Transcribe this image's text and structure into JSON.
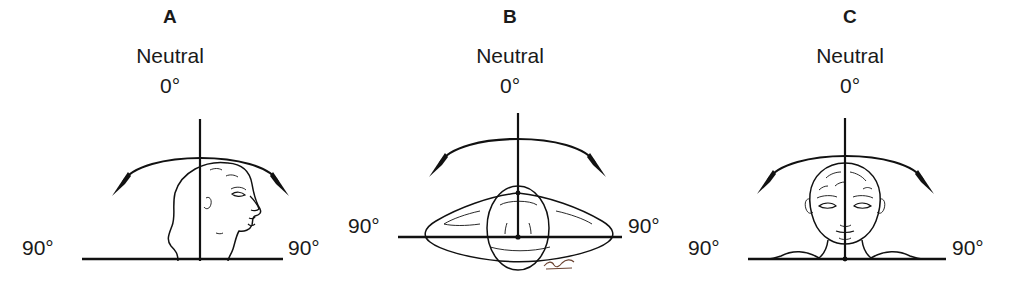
{
  "figure": {
    "background": "#ffffff",
    "ink_color": "#111111",
    "signature_color": "#6b4230"
  },
  "panels": [
    {
      "id": "panel-a",
      "letter": "A",
      "view": "lateral-profile-head",
      "motion": "flexion-extension",
      "neutral_word": "Neutral",
      "neutral_degrees": "0°",
      "left_degrees": "90°",
      "right_degrees": "90°",
      "baseline_y": 259,
      "arrow": "double-headed-arc"
    },
    {
      "id": "panel-b",
      "letter": "B",
      "view": "superior-axial-head-shoulders",
      "motion": "rotation",
      "neutral_word": "Neutral",
      "neutral_degrees": "0°",
      "left_degrees": "90°",
      "right_degrees": "90°",
      "baseline_y": 237,
      "arrow": "double-headed-arc",
      "signature": true
    },
    {
      "id": "panel-c",
      "letter": "C",
      "view": "anterior-frontal-head-shoulders",
      "motion": "lateral-flexion",
      "neutral_word": "Neutral",
      "neutral_degrees": "0°",
      "left_degrees": "90°",
      "right_degrees": "90°",
      "baseline_y": 259,
      "arrow": "double-headed-arc"
    }
  ]
}
